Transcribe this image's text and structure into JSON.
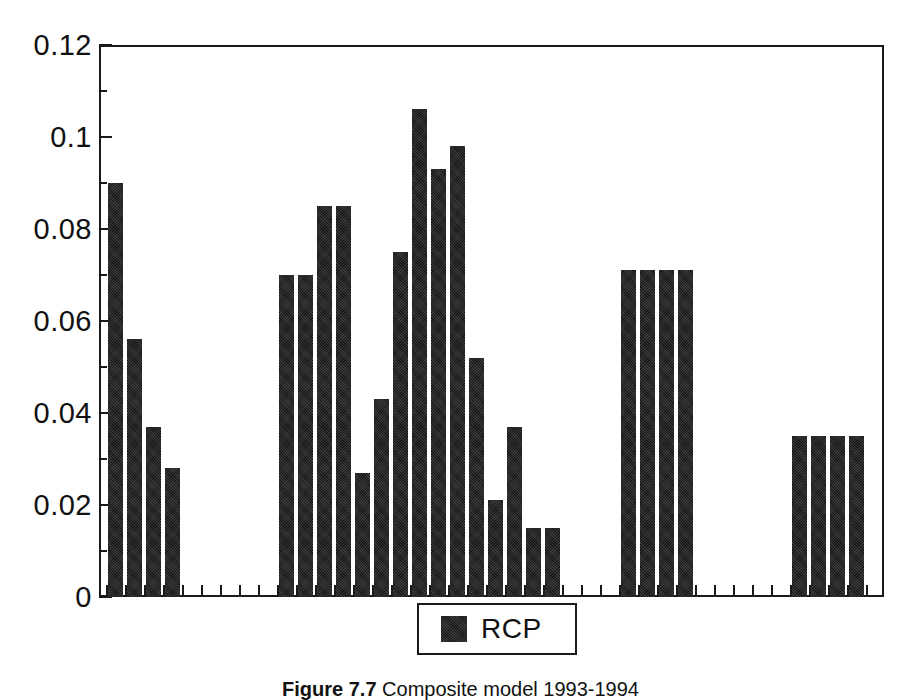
{
  "chart_data": {
    "type": "bar",
    "title": "",
    "xlabel": "",
    "ylabel": "",
    "ylim": [
      0,
      0.12
    ],
    "ytick_labels": [
      "0",
      "0.02",
      "0.04",
      "0.06",
      "0.08",
      "0.1",
      "0.12"
    ],
    "ytick_values": [
      0,
      0.02,
      0.04,
      0.06,
      0.08,
      0.1,
      0.12
    ],
    "ytick_minor_values": [
      0.01,
      0.03,
      0.05,
      0.07,
      0.09,
      0.11
    ],
    "xtick_labels": [],
    "grid": false,
    "legend_position": "bottom-center",
    "series": [
      {
        "name": "RCP",
        "color": "#161616",
        "values": [
          0.09,
          0.056,
          0.037,
          0.028,
          null,
          null,
          null,
          null,
          null,
          0.07,
          0.07,
          0.085,
          0.085,
          0.027,
          0.043,
          0.075,
          0.106,
          0.093,
          0.098,
          0.052,
          0.021,
          0.037,
          0.015,
          0.015,
          null,
          null,
          null,
          0.071,
          0.071,
          0.071,
          0.071,
          null,
          null,
          null,
          null,
          null,
          0.035,
          0.035,
          0.035,
          0.035,
          null,
          null,
          null
        ]
      }
    ],
    "clusters": [
      {
        "name": "cluster-1",
        "start_index": 0,
        "values": [
          0.09,
          0.056,
          0.037,
          0.028
        ]
      },
      {
        "name": "cluster-2",
        "start_index": 9,
        "values": [
          0.07,
          0.07,
          0.085,
          0.085,
          0.027,
          0.043,
          0.075,
          0.106,
          0.093,
          0.098,
          0.052,
          0.021,
          0.037,
          0.015,
          0.015
        ]
      },
      {
        "name": "cluster-3",
        "start_index": 27,
        "values": [
          0.071,
          0.071,
          0.071,
          0.071
        ]
      },
      {
        "name": "cluster-4",
        "start_index": 36,
        "values": [
          0.035,
          0.035,
          0.035,
          0.035
        ]
      }
    ]
  },
  "legend": {
    "label": "RCP"
  },
  "caption": {
    "label": "Figure 7.7",
    "text": " Composite model 1993-1994"
  }
}
